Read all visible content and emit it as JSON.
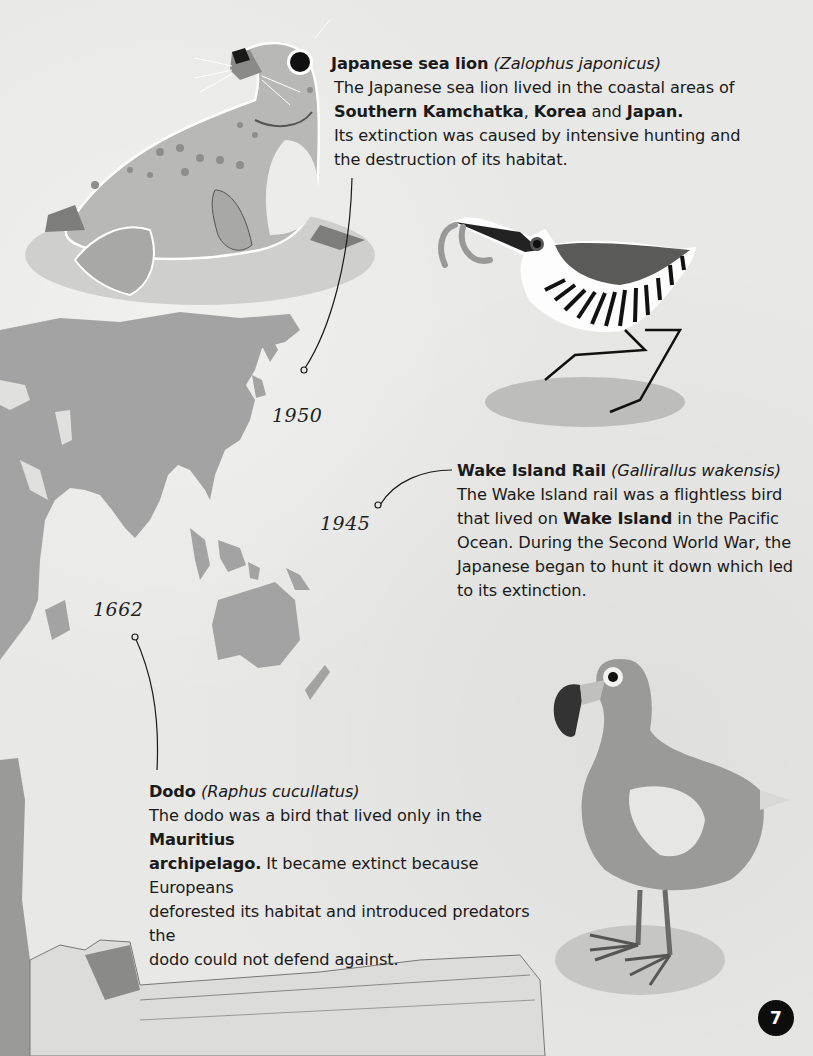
{
  "page": {
    "number": "7"
  },
  "timeline": {
    "years": [
      "1950",
      "1945",
      "1662"
    ]
  },
  "species": [
    {
      "id": "japanese-sea-lion",
      "common_name": "Japanese sea lion",
      "scientific_name": "(Zalophus japonicus)",
      "year": "1950",
      "description": {
        "line1": "The Japanese sea lion lived in the coastal areas of",
        "bold1": "Southern Kamchatka",
        "sep1": ", ",
        "bold2": "Korea",
        "sep2": " and ",
        "bold3": "Japan",
        "end": ".",
        "line3": "Its extinction was caused by intensive hunting and",
        "line4": "the destruction of its habitat."
      }
    },
    {
      "id": "wake-island-rail",
      "common_name": "Wake Island Rail",
      "scientific_name": "(Gallirallus wakensis)",
      "year": "1945",
      "description": {
        "line1": "The Wake Island rail was a flightless bird",
        "pre2": "that lived on ",
        "bold1": "Wake Island",
        "post2": " in the Pacific",
        "line3": "Ocean. During the Second World War, the",
        "line4": "Japanese began to hunt it down which led",
        "line5": "to its extinction."
      }
    },
    {
      "id": "dodo",
      "common_name": "Dodo",
      "scientific_name": "(Raphus cucullatus)",
      "year": "1662",
      "description": {
        "pre1": "The dodo was a bird that lived only in the ",
        "bold1": "Mauritius",
        "bold2": "archipelago.",
        "post2": " It became extinct because Europeans",
        "line3": "deforested its habitat and introduced predators the",
        "line4": "dodo could not defend against."
      }
    }
  ],
  "colors": {
    "paper": "#e8e8e6",
    "map": "#a3a3a3",
    "text": "#1a1a1a",
    "badge": "#0d0d0d"
  }
}
